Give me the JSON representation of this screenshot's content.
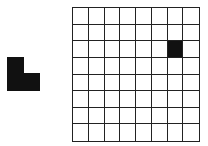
{
  "piece": {
    "shape": "L-tromino",
    "color": "#111111",
    "blocks": [
      {
        "x": 0,
        "y": 0,
        "w": 17,
        "h": 34
      },
      {
        "x": 17,
        "y": 16,
        "w": 16,
        "h": 18
      }
    ]
  },
  "grid": {
    "rows": 8,
    "cols": 8,
    "filled_cells": [
      {
        "row": 2,
        "col": 6
      }
    ],
    "fill_color": "#111111",
    "line_color": "#222222"
  }
}
